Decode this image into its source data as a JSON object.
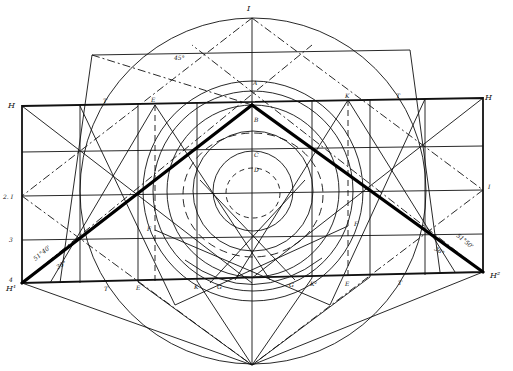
{
  "figure": {
    "type": "geometric-construction",
    "background": "#ffffff",
    "ink": "#111111"
  },
  "labels": {
    "top_I": "I",
    "top_angle": "45°",
    "A": "A",
    "B": "B",
    "C": "C",
    "D": "D",
    "H_top_left": "H",
    "H_top_right": "H",
    "E_left_top": "E",
    "E_right_top": "E",
    "K_right_top": "K",
    "T_left_top": "T",
    "T_right_top": "T",
    "I_left": "2. I",
    "I_right": "I",
    "row3": "3",
    "row4": "4",
    "H1": "H¹",
    "H2": "H²",
    "F_left": "F",
    "F_right": "F",
    "angle_left_a": "51°40'",
    "angle_left_b": "36°",
    "angle_right_a": "51°50'",
    "angle_right_b": "36°",
    "T_bottom_left": "T",
    "E_bottom_left": "E",
    "K_bottom_left": "K",
    "G_left": "G",
    "G_right": "G",
    "K_bottom_right": "K²",
    "E_bottom_right": "E",
    "T_bottom_right": "T"
  }
}
